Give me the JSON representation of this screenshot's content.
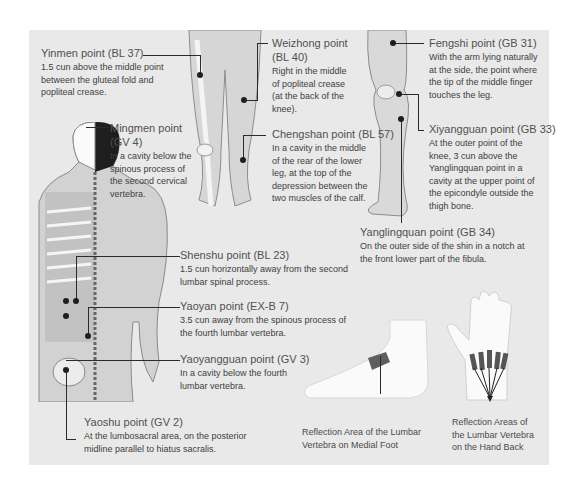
{
  "points": [
    {
      "id": "yinmen",
      "title": "Yinmen point (BL 37)",
      "desc": "1.5 cun above the middle point between the gluteal fold and popliteal crease."
    },
    {
      "id": "weizhong",
      "title_line1": "Weizhong point",
      "title_line2": "(BL 40)",
      "desc": "Right in the middle of popliteal crease (at the back of the knee)."
    },
    {
      "id": "chengshan",
      "title": "Chengshan point (BL 57)",
      "desc": "In a cavity in the middle of the rear of the lower leg, at the top of the depression between the two muscles of the calf."
    },
    {
      "id": "fengshi",
      "title": "Fengshi point (GB 31)",
      "desc": "With the arm lying naturally at the side, the point where the tip of the middle finger touches the leg."
    },
    {
      "id": "xiyangguan",
      "title": "Xiyangguan point (GB 33)",
      "desc": "At the outer point of the knee, 3 cun above the Yanglingquan point in a cavity at the upper point of the epicondyle outside the thigh bone."
    },
    {
      "id": "yanglingquan",
      "title": "Yanglingquan point (GB 34)",
      "desc": "On the outer side of the shin in a notch at the front lower part of the fibula."
    },
    {
      "id": "mingmen",
      "title_line1": "Mingmen point",
      "title_line2": "(GV 4)",
      "desc": "In a cavity below the spinous process of the second cervical vertebra."
    },
    {
      "id": "shenshu",
      "title": "Shenshu point (BL 23)",
      "desc": "1.5 cun horizontally away from the second lumbar spinal process."
    },
    {
      "id": "yaoyan",
      "title": "Yaoyan point (EX-B 7)",
      "desc": "3.5 cun away from the spinous process of the fourth lumbar vertebra."
    },
    {
      "id": "yaoyangguan",
      "title": "Yaoyangguan point (GV 3)",
      "desc": "In a cavity below the fourth lumbar vertebra."
    },
    {
      "id": "yaoshu",
      "title": "Yaoshu point (GV 2)",
      "desc": "At the lumbosacral area, on the posterior midline parallel to hiatus sacralis."
    }
  ],
  "captions": {
    "foot": "Reflection Area of the Lumbar Vertebra on Medial Foot",
    "hand": "Reflection Areas of the Lumbar Vertebra on the Hand Back"
  },
  "colors": {
    "panel_bg": "#e9e9e9",
    "line": "#2b2b2b",
    "text": "#4a4a4a"
  }
}
